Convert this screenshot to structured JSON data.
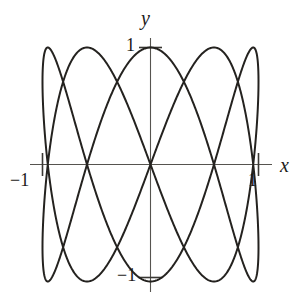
{
  "figure": {
    "title": "",
    "background_color": "#ffffff",
    "curve_color": "#24221f",
    "axis_color": "#56544f"
  },
  "axes": {
    "x_label": "x",
    "y_label": "y",
    "x_ticks": [
      {
        "label": "−1",
        "value": -1
      },
      {
        "label": "1",
        "value": 1
      }
    ],
    "y_ticks": [
      {
        "label": "1",
        "value": 1
      },
      {
        "label": "−1",
        "value": -1
      }
    ]
  },
  "chart_data": {
    "type": "line",
    "title": "",
    "xlabel": "x",
    "ylabel": "y",
    "xlim": [
      -1.25,
      1.4
    ],
    "ylim": [
      -1.4,
      1.45
    ],
    "grid": false,
    "legend": null,
    "parametric": {
      "x_expression": "sin(2t)",
      "y_expression": "sin(5t)",
      "t_range": [
        0,
        6.283185307179586
      ],
      "x_frequency": 2,
      "y_frequency": 5,
      "phase": 0,
      "amplitude_x": 1,
      "amplitude_y": 1
    },
    "tick_values": {
      "x": [
        -1,
        1
      ],
      "y": [
        -1,
        1
      ]
    },
    "tick_labels": {
      "x": [
        "−1",
        "1"
      ],
      "y": [
        "−1",
        "1"
      ]
    },
    "axis_crossings_on_x_axis": [
      -1,
      -0.587785,
      0,
      0.587785,
      0.951057,
      1
    ],
    "extrema_top_x": [
      -0.951057,
      -0.587785,
      0.0,
      0.587785,
      0.951057
    ],
    "extrema_bottom_x": [
      -0.951057,
      -0.587785,
      0.0,
      0.587785,
      0.951057
    ],
    "extrema_left_y": [
      -0.587785,
      0.587785
    ],
    "extrema_right_y": [
      -0.587785,
      0.587785
    ],
    "x": [],
    "y": []
  }
}
